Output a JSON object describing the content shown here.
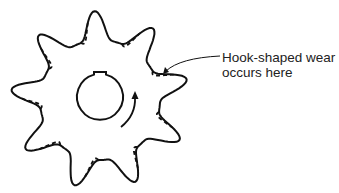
{
  "diagram": {
    "teeth": 9,
    "rotation_direction": "clockwise",
    "annotation": {
      "line1": "Hook-shaped wear",
      "line2": "occurs here"
    },
    "legend": {
      "solid_outline": "original tooth profile",
      "dashed_outline": "worn tooth profile"
    },
    "colors": {
      "stroke": "#111111",
      "background": "#ffffff"
    }
  }
}
